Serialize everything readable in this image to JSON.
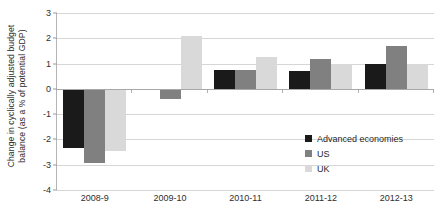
{
  "chart_data": {
    "type": "bar",
    "title": "",
    "subtitle": "",
    "xlabel": "",
    "ylabel": "Change in cyclically adjusted budget\nbalance (as a % of potential GDP)",
    "categories": [
      "2008-9",
      "2009-10",
      "2010-11",
      "2011-12",
      "2012-13"
    ],
    "series": [
      {
        "name": "Advanced economies",
        "color": "#1a1a1a",
        "values": [
          -2.35,
          -0.05,
          0.75,
          0.7,
          1.0
        ]
      },
      {
        "name": "US",
        "color": "#808080",
        "values": [
          -2.95,
          -0.4,
          0.75,
          1.2,
          1.7
        ]
      },
      {
        "name": "UK",
        "color": "#d9d9d9",
        "values": [
          -2.45,
          2.1,
          1.25,
          1.0,
          1.0
        ]
      }
    ],
    "ylim": [
      -4,
      3
    ],
    "yticks": [
      3,
      2,
      1,
      0,
      -1,
      -2,
      -3,
      -4
    ],
    "ytick_labels": [
      "3",
      "2",
      "1",
      "0",
      "-1",
      "-2",
      "-3",
      "-4"
    ],
    "grid": true,
    "legend_position": "inside-bottom-right"
  }
}
